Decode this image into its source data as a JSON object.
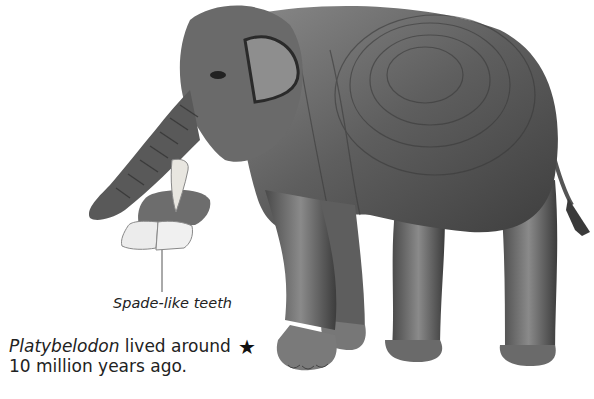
{
  "illustration": {
    "subject": "Platybelodon",
    "colors": {
      "body_dark": "#3a3a3a",
      "body_mid": "#6e6e6e",
      "body_light": "#a8a8a8",
      "teeth": "#ececec",
      "background": "#ffffff"
    }
  },
  "annotation": {
    "label": "Spade-like teeth"
  },
  "caption": {
    "name": "Platybelodon",
    "line1_rest": " lived around",
    "line2": "10 million years ago."
  },
  "marker": {
    "icon": "star-icon",
    "glyph": "★"
  }
}
